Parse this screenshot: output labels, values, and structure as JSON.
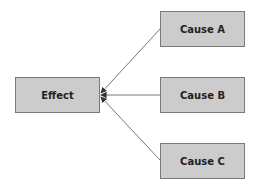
{
  "diagram": {
    "type": "cause-effect",
    "effect": {
      "label": "Effect"
    },
    "causes": [
      {
        "label": "Cause A"
      },
      {
        "label": "Cause B"
      },
      {
        "label": "Cause C"
      }
    ],
    "colors": {
      "box_fill": "#cccccc",
      "box_border": "#7a7a7a",
      "arrow": "#555555"
    }
  }
}
